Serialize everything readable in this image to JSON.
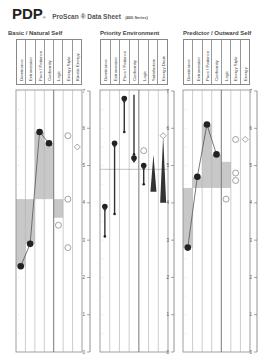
{
  "title": {
    "brand": "PDP",
    "reg": "®",
    "product": "ProScan",
    "suffix": "® Data Sheet",
    "series": "(400 Series)"
  },
  "chart_data": [
    {
      "type": "line",
      "title": "Basic / Natural Self",
      "columns": [
        "Dominance",
        "Extroversion",
        "Pace / Patience",
        "Conformity",
        "Logic",
        "Energy Style",
        "Kinetic Energy"
      ],
      "ylim": [
        0,
        7
      ],
      "yticks": [
        "0",
        "1",
        "2",
        "3",
        "4",
        "5",
        "6",
        "7"
      ],
      "points": [
        {
          "col": 0,
          "value": 2.3
        },
        {
          "col": 1,
          "value": 2.9
        },
        {
          "col": 2,
          "value": 5.9
        },
        {
          "col": 3,
          "value": 5.6
        }
      ],
      "bars": [
        {
          "col": 0,
          "from": 4.1,
          "to": 2.3
        },
        {
          "col": 1,
          "from": 4.1,
          "to": 2.9
        },
        {
          "col": 2,
          "from": 4.1,
          "to": 5.9
        },
        {
          "col": 3,
          "from": 4.1,
          "to": 5.6
        },
        {
          "col": 4,
          "from": 4.1,
          "to": 3.6
        }
      ],
      "markers": [
        {
          "col": 5,
          "value": 5.8,
          "shape": "circle"
        },
        {
          "col": 6,
          "value": 5.5,
          "shape": "diamond"
        },
        {
          "col": 5,
          "value": 4.1,
          "shape": "circle"
        },
        {
          "col": 4,
          "value": 3.4,
          "shape": "circle"
        },
        {
          "col": 5,
          "value": 2.8,
          "shape": "circle"
        }
      ]
    },
    {
      "type": "range",
      "title": "Priority Environment",
      "columns": [
        "Dominance",
        "Extroversion",
        "Pace / Patience",
        "Conformity",
        "Logic",
        "Satisfaction",
        "Energy Drain"
      ],
      "ylim": [
        0,
        7
      ],
      "yticks": [
        "0",
        "1",
        "2",
        "3",
        "4",
        "5",
        "6",
        "7"
      ],
      "midline": 4.9,
      "ranges": [
        {
          "col": 0,
          "value": 3.9,
          "low": 3.1,
          "high": 3.8
        },
        {
          "col": 1,
          "value": 5.6,
          "low": 3.7,
          "high": 5.5
        },
        {
          "col": 2,
          "value": 6.8,
          "low": 5.9,
          "high": 6.8
        },
        {
          "col": 3,
          "value": 5.2,
          "low": 5.3,
          "high": 6.9
        },
        {
          "col": 4,
          "value": 5.0,
          "low": 4.5,
          "high": 5.0
        }
      ],
      "markers": [
        {
          "col": 4,
          "value": 5.4,
          "shape": "circle"
        },
        {
          "col": 6,
          "value": 5.8,
          "shape": "diamond"
        }
      ],
      "wedges": [
        {
          "col": 5,
          "top": 5.3,
          "bottom": 4.3
        },
        {
          "col": 6,
          "top": 5.8,
          "bottom": 4.0
        }
      ]
    },
    {
      "type": "line",
      "title": "Predictor / Outward Self",
      "columns": [
        "Dominance",
        "Extroversion",
        "Pace / Patience",
        "Conformity",
        "Logic",
        "Energy Style",
        "Energy"
      ],
      "ylim": [
        0,
        7
      ],
      "yticks": [
        "0",
        "1",
        "2",
        "3",
        "4",
        "5",
        "6",
        "7"
      ],
      "points": [
        {
          "col": 0,
          "value": 2.8
        },
        {
          "col": 1,
          "value": 4.7
        },
        {
          "col": 2,
          "value": 6.1
        },
        {
          "col": 3,
          "value": 5.3
        }
      ],
      "bars": [
        {
          "col": 0,
          "from": 4.4,
          "to": 2.8
        },
        {
          "col": 1,
          "from": 4.4,
          "to": 4.7
        },
        {
          "col": 2,
          "from": 4.4,
          "to": 6.1
        },
        {
          "col": 3,
          "from": 4.4,
          "to": 5.3
        },
        {
          "col": 4,
          "from": 4.4,
          "to": 5.1
        }
      ],
      "markers": [
        {
          "col": 5,
          "value": 5.7,
          "shape": "circle"
        },
        {
          "col": 6,
          "value": 5.7,
          "shape": "diamond"
        },
        {
          "col": 5,
          "value": 4.8,
          "shape": "circle"
        },
        {
          "col": 5,
          "value": 4.6,
          "shape": "circle"
        },
        {
          "col": 4,
          "value": 4.1,
          "shape": "circle"
        }
      ]
    }
  ]
}
